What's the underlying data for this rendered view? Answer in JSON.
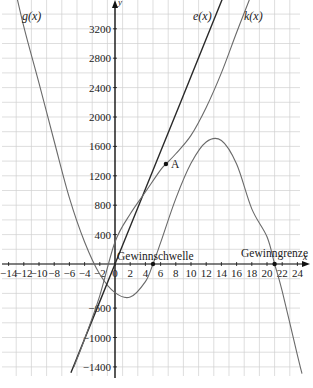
{
  "chart_data": {
    "type": "line",
    "title": "",
    "xlabel": "x",
    "ylabel": "y",
    "xlim": [
      -15,
      24.6
    ],
    "ylim": [
      -1500,
      3600
    ],
    "grid": true,
    "x_ticks": [
      -14,
      -12,
      -10,
      -8,
      -6,
      -4,
      -2,
      0,
      2,
      4,
      6,
      8,
      10,
      12,
      14,
      16,
      18,
      20,
      22,
      24
    ],
    "x_tick_labels": [
      "−14",
      "−12",
      "−10",
      "−8",
      "−6",
      "−4",
      "−2",
      "0",
      "2",
      "4",
      "6",
      "8",
      "10",
      "12",
      "14",
      "16",
      "18",
      "20",
      "22",
      "24"
    ],
    "y_ticks": [
      3200,
      2800,
      2400,
      2000,
      1600,
      1200,
      800,
      400,
      -600,
      -1000,
      -1400
    ],
    "y_tick_labels": [
      "3200",
      "2800",
      "2400",
      "2000",
      "1600",
      "1200",
      "800",
      "400",
      "−600",
      "−1000",
      "−1400"
    ],
    "series": [
      {
        "name": "g(x)",
        "label": "g(x)",
        "kind": "cubic profit",
        "x": [
          -13.5,
          -12,
          -10,
          -8,
          -6,
          -4,
          -2,
          0,
          2,
          4,
          5,
          6,
          8,
          10,
          12,
          14,
          16,
          18,
          20,
          21,
          22,
          24,
          24.6
        ],
        "y": [
          3900,
          3230,
          2460,
          1670,
          900,
          300,
          -140,
          -390,
          -450,
          -240,
          0,
          290,
          890,
          1370,
          1660,
          1680,
          1360,
          750,
          370,
          0,
          -370,
          -1240,
          -1490
        ]
      },
      {
        "name": "e(x)",
        "label": "e(x)",
        "kind": "linear revenue",
        "x": [
          -5.8,
          0,
          4,
          6,
          10,
          14.1
        ],
        "y": [
          -1480,
          0,
          1020,
          1530,
          2550,
          3600
        ]
      },
      {
        "name": "k(x)",
        "label": "k(x)",
        "kind": "cubic cost",
        "x": [
          -5.4,
          -4,
          -2,
          0,
          2,
          4,
          6,
          6.7,
          8,
          10,
          12,
          14,
          16,
          17.7
        ],
        "y": [
          -1400,
          -1020,
          -430,
          300,
          680,
          980,
          1280,
          1360,
          1500,
          1750,
          2130,
          2600,
          3150,
          3600
        ]
      }
    ],
    "points": [
      {
        "label": "A",
        "x": 6.7,
        "y": 1360
      },
      {
        "label": "Gewinnschwelle",
        "x": 5,
        "y": 0
      },
      {
        "label": "Gewinngrenze",
        "x": 21,
        "y": 0
      }
    ]
  },
  "labels": {
    "g": "g(x)",
    "e": "e(x)",
    "k": "k(x)",
    "point_a": "A",
    "gewinnschwelle": "Gewinnschwelle",
    "gewinngrenze": "Gewinngrenze",
    "x_axis": "x",
    "y_axis": "y"
  }
}
